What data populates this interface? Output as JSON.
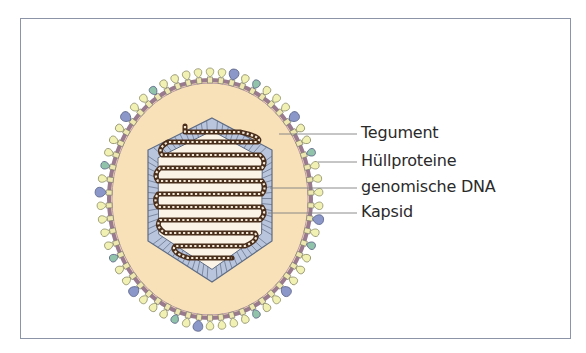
{
  "figure": {
    "type": "virus-structure-schematic",
    "labels": [
      {
        "id": "tegument",
        "text": "Tegument",
        "y": 134,
        "line_from_x": 279
      },
      {
        "id": "huellproteine",
        "text": "Hüllproteine",
        "y": 162,
        "line_from_x": 318
      },
      {
        "id": "genomische-dna",
        "text": "genomische DNA",
        "y": 188,
        "line_from_x": 270
      },
      {
        "id": "kapsid",
        "text": "Kapsid",
        "y": 213,
        "line_from_x": 268
      }
    ],
    "colors": {
      "frame": "#8c94a8",
      "tegument_fill": "#f8e0b8",
      "membrane": "#9a7a8e",
      "spike_yellow": "#f2f1b4",
      "spike_blue": "#8c97c9",
      "spike_teal": "#90c3aa",
      "spike_outline": "#7a7a6a",
      "capsid_fill": "#b9c5dd",
      "capsid_outline": "#5e6c84",
      "capsid_inner": "#fbf3e6",
      "dna": "#4a2e1c",
      "leader_line": "#808080"
    },
    "geometry": {
      "center": [
        210,
        199
      ],
      "envelope_rx": 101,
      "envelope_ry": 119,
      "spike_count": 58,
      "hexagon": [
        [
          212,
          118
        ],
        [
          272,
          150
        ],
        [
          272,
          241
        ],
        [
          212,
          282
        ],
        [
          148,
          241
        ],
        [
          148,
          150
        ]
      ],
      "capsid_thickness": 11
    }
  }
}
